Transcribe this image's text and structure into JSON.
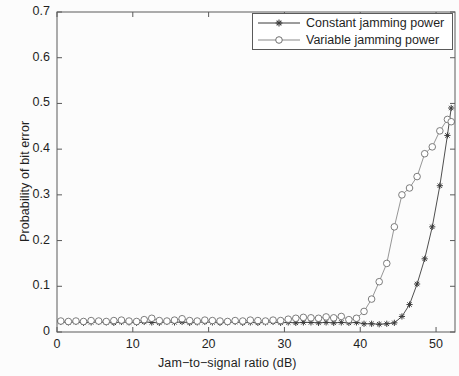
{
  "figure": {
    "background": "#fcfcfc",
    "axis_color": "#5a5a5a",
    "text_color": "#1f1f1f"
  },
  "axes": {
    "ylabel": "Probability of bit error",
    "xlabel": "Jam−to−signal ratio (dB)",
    "ytick_labels": [
      "0",
      "0.1",
      "0.2",
      "0.3",
      "0.4",
      "0.5",
      "0.6",
      "0.7"
    ],
    "xtick_labels": [
      "0",
      "10",
      "20",
      "30",
      "40",
      "50"
    ]
  },
  "legend": {
    "position": "top-right",
    "entries": [
      {
        "label": "Constant jamming power",
        "marker": "star-marker",
        "color": "#3b3b3b"
      },
      {
        "label": "Variable jamming power",
        "marker": "circle-marker",
        "color": "#8a8a8a"
      }
    ]
  },
  "chart_data": {
    "type": "line",
    "title": "",
    "xlabel": "Jam−to−signal ratio (dB)",
    "ylabel": "Probability of bit error",
    "xlim": [
      0,
      52.5
    ],
    "ylim": [
      0,
      0.7
    ],
    "xticks": [
      0,
      10,
      20,
      30,
      40,
      50
    ],
    "yticks": [
      0,
      0.1,
      0.2,
      0.3,
      0.4,
      0.5,
      0.6,
      0.7
    ],
    "grid": false,
    "legend_position": "upper right",
    "series": [
      {
        "name": "Constant jamming power",
        "marker": "star",
        "color": "#3b3b3b",
        "x": [
          0.5,
          1.5,
          2.5,
          3.5,
          4.5,
          5.5,
          6.5,
          7.5,
          8.5,
          9.5,
          10.5,
          11.5,
          12.5,
          13.5,
          14.5,
          15.5,
          16.5,
          17.5,
          18.5,
          19.5,
          20.5,
          21.5,
          22.5,
          23.5,
          24.5,
          25.5,
          26.5,
          27.5,
          28.5,
          29.5,
          30.5,
          31.5,
          32.5,
          33.5,
          34.5,
          35.5,
          36.5,
          37.5,
          38.5,
          39.5,
          40.5,
          41.5,
          42.5,
          43.5,
          44.5,
          45.5,
          46.5,
          47.5,
          48.5,
          49.5,
          50.5,
          51.5,
          52.0
        ],
        "y": [
          0.022,
          0.021,
          0.022,
          0.02,
          0.021,
          0.022,
          0.021,
          0.02,
          0.022,
          0.021,
          0.02,
          0.022,
          0.021,
          0.02,
          0.022,
          0.021,
          0.022,
          0.02,
          0.021,
          0.022,
          0.021,
          0.02,
          0.021,
          0.022,
          0.02,
          0.021,
          0.02,
          0.021,
          0.022,
          0.02,
          0.021,
          0.02,
          0.021,
          0.021,
          0.02,
          0.021,
          0.02,
          0.021,
          0.02,
          0.021,
          0.018,
          0.018,
          0.017,
          0.018,
          0.02,
          0.034,
          0.06,
          0.105,
          0.16,
          0.23,
          0.32,
          0.43,
          0.49
        ]
      },
      {
        "name": "Variable jamming power",
        "marker": "circle",
        "color": "#8a8a8a",
        "x": [
          0.5,
          1.5,
          2.5,
          3.5,
          4.5,
          5.5,
          6.5,
          7.5,
          8.5,
          9.5,
          10.5,
          11.5,
          12.5,
          13.5,
          14.5,
          15.5,
          16.5,
          17.5,
          18.5,
          19.5,
          20.5,
          21.5,
          22.5,
          23.5,
          24.5,
          25.5,
          26.5,
          27.5,
          28.5,
          29.5,
          30.5,
          31.5,
          32.5,
          33.5,
          34.5,
          35.5,
          36.5,
          37.5,
          38.5,
          39.5,
          40.5,
          41.5,
          42.5,
          43.5,
          44.5,
          45.5,
          46.5,
          47.5,
          48.5,
          49.5,
          50.5,
          51.5,
          52.0
        ],
        "y": [
          0.024,
          0.023,
          0.024,
          0.023,
          0.025,
          0.024,
          0.023,
          0.025,
          0.026,
          0.024,
          0.023,
          0.027,
          0.03,
          0.025,
          0.024,
          0.026,
          0.029,
          0.025,
          0.024,
          0.026,
          0.025,
          0.024,
          0.023,
          0.025,
          0.024,
          0.026,
          0.025,
          0.024,
          0.026,
          0.025,
          0.028,
          0.03,
          0.032,
          0.031,
          0.03,
          0.033,
          0.031,
          0.034,
          0.027,
          0.03,
          0.045,
          0.072,
          0.11,
          0.15,
          0.23,
          0.3,
          0.315,
          0.34,
          0.39,
          0.405,
          0.44,
          0.465,
          0.46
        ]
      }
    ]
  }
}
